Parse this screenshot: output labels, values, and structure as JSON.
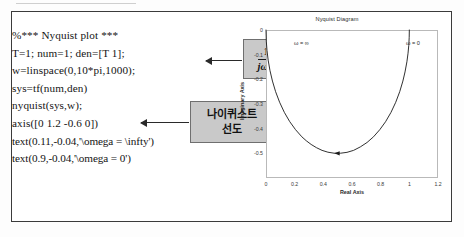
{
  "figure": {
    "code_lines": [
      "%*** Nyquist plot ***",
      "T=1; num=1; den=[T 1];",
      "w=linspace(0,10*pi,1000);",
      "sys=tf(num,den)",
      "nyquist(sys,w);",
      "axis([0 1.2 -0.6 0])",
      "text(0.11,-0.04,'\\omega = \\infty')",
      "text(0.9,-0.04,'\\omega = 0')"
    ],
    "callouts": {
      "transfer_function": {
        "numerator": "1",
        "denominator": "jωT"
      },
      "korean_label_line1": "나이퀴스트",
      "korean_label_line2": "선도"
    }
  },
  "chart_data": {
    "type": "line",
    "title": "Nyquist Diagram",
    "xlabel": "Real Axis",
    "ylabel": "Imaginary Axis",
    "xlim": [
      0,
      1.2
    ],
    "ylim": [
      -0.6,
      0
    ],
    "xticks": [
      "0",
      "0.2",
      "0.4",
      "0.6",
      "0.8",
      "1",
      "1.2"
    ],
    "xtick_values": [
      0,
      0.2,
      0.4,
      0.6,
      0.8,
      1,
      1.2
    ],
    "yticks": [
      "0",
      "-0.1",
      "-0.2",
      "-0.3",
      "-0.4",
      "-0.5"
    ],
    "ytick_values": [
      0,
      -0.1,
      -0.2,
      -0.3,
      -0.4,
      -0.5
    ],
    "grid": false,
    "legend": null,
    "annotations": [
      {
        "text": "ω = ∞",
        "x": 0.11,
        "y": -0.04
      },
      {
        "text": "ω = 0",
        "x": 0.9,
        "y": -0.04
      }
    ],
    "series": [
      {
        "name": "1/(1+jwT)",
        "comment": "Semicircle centered (0.5,0) radius 0.5 in lower half plane",
        "x": [
          1.0,
          0.999,
          0.996,
          0.991,
          0.983,
          0.97,
          0.955,
          0.933,
          0.905,
          0.872,
          0.834,
          0.794,
          0.75,
          0.705,
          0.658,
          0.611,
          0.565,
          0.519,
          0.475,
          0.432,
          0.391,
          0.352,
          0.315,
          0.281,
          0.25,
          0.206,
          0.165,
          0.128,
          0.095,
          0.067,
          0.045,
          0.028,
          0.015,
          0.007,
          0.002,
          0.0
        ],
        "y": [
          0.0,
          -0.031,
          -0.063,
          -0.094,
          -0.129,
          -0.17,
          -0.207,
          -0.25,
          -0.293,
          -0.334,
          -0.372,
          -0.404,
          -0.433,
          -0.456,
          -0.474,
          -0.488,
          -0.496,
          -0.4996,
          -0.4994,
          -0.4954,
          -0.488,
          -0.477,
          -0.464,
          -0.449,
          -0.433,
          -0.404,
          -0.371,
          -0.334,
          -0.293,
          -0.25,
          -0.207,
          -0.165,
          -0.122,
          -0.083,
          -0.045,
          0.0
        ],
        "arrow_marker": {
          "x": 0.5,
          "y": -0.5,
          "direction": "left"
        }
      }
    ]
  }
}
